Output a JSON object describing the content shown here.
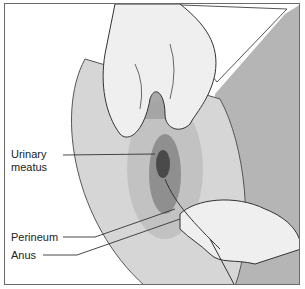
{
  "figure": {
    "colors": {
      "border": "#6a6a6a",
      "skin_light": "#e6e6e6",
      "skin_mid": "#c9c9c9",
      "skin_dark": "#9a9a9a",
      "line": "#333333",
      "background_right": "#b8b8b8"
    },
    "labels": [
      {
        "id": "urinary-meatus",
        "lines": [
          "Urinary",
          "meatus"
        ]
      },
      {
        "id": "perineum",
        "lines": [
          "Perineum"
        ]
      },
      {
        "id": "anus",
        "lines": [
          "Anus"
        ]
      }
    ]
  }
}
